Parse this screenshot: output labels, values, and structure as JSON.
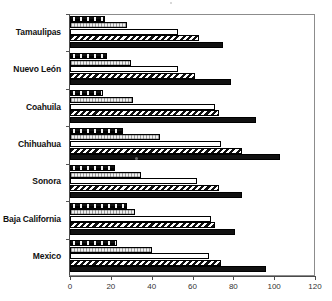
{
  "figure": {
    "title_remnant": "·",
    "background": "#ffffff",
    "frame_color": "#8c8c8c"
  },
  "axis": {
    "tick_labels": [
      "0",
      "20",
      "40",
      "60",
      "80",
      "100",
      "120"
    ],
    "tick_values": [
      0,
      20,
      40,
      60,
      80,
      100,
      120
    ],
    "xlabel": "",
    "ylabel": ""
  },
  "chart_data": {
    "type": "bar",
    "orientation": "horizontal",
    "title": "",
    "subtitle": "",
    "xlabel": "",
    "ylabel": "",
    "xlim": [
      0,
      120
    ],
    "grid": false,
    "legend": "none",
    "categories": [
      "Tamaulipas",
      "Nuevo León",
      "Coahuila",
      "Chihuahua",
      "Sonora",
      "Baja California",
      "Mexico"
    ],
    "series": [
      {
        "name": "Series 1",
        "pattern": "black-with-white-specks",
        "color": "#111111",
        "values": [
          17,
          18,
          16,
          26,
          22,
          28,
          23
        ]
      },
      {
        "name": "Series 2",
        "pattern": "light-stipple",
        "color": "#f0f0f0",
        "values": [
          28,
          30,
          31,
          44,
          35,
          32,
          40
        ]
      },
      {
        "name": "Series 3",
        "pattern": "white-empty",
        "color": "#ffffff",
        "values": [
          53,
          53,
          71,
          74,
          62,
          69,
          68
        ]
      },
      {
        "name": "Series 4",
        "pattern": "diagonal-hatch",
        "color": "#111111",
        "values": [
          63,
          61,
          73,
          84,
          73,
          71,
          74
        ]
      },
      {
        "name": "Series 5",
        "pattern": "solid-black",
        "color": "#111111",
        "values": [
          75,
          79,
          91,
          103,
          84,
          81,
          96
        ]
      }
    ]
  }
}
